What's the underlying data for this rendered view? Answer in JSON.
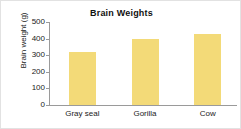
{
  "chart_data": {
    "type": "bar",
    "title": "Brain Weights",
    "xlabel": "",
    "ylabel": "Brain weight (g)",
    "categories": [
      "Gray seal",
      "Gorilla",
      "Cow"
    ],
    "values": [
      320,
      400,
      425
    ],
    "ylim": [
      0,
      500
    ],
    "yticks": [
      0,
      100,
      200,
      300,
      400,
      500
    ],
    "ytick_labels": [
      "0",
      "100",
      "200",
      "300",
      "400",
      "500"
    ],
    "grid": false,
    "legend": null,
    "bar_color": "#f3da78",
    "axis_color": "#9a9a9a",
    "text_color": "#1a1a1a"
  }
}
